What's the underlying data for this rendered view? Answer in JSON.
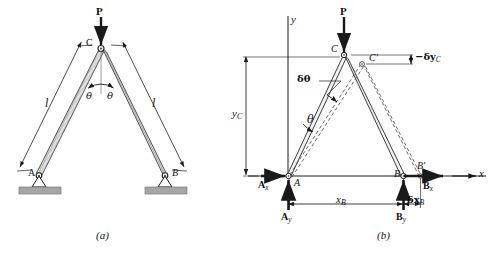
{
  "figure": {
    "background": "#ffffff",
    "ink": "#1a1a1a",
    "member_fill": "#d9d9d9",
    "ground_fill": "#9a9a9a",
    "dash_color": "#555555"
  },
  "panel_a": {
    "caption": "(a)",
    "load_label": "P",
    "joint_c": "C",
    "joint_a": "A",
    "joint_b": "B",
    "length_left": "l",
    "length_right": "l",
    "angle_left": "θ",
    "angle_right": "θ",
    "icons": {
      "load_arrow": "down-arrow-icon",
      "pin_support": "pin-support-icon",
      "ground_hatch": "ground-hatch-icon",
      "dimension_arrow": "dimension-arrow-icon",
      "angle_arc": "angle-arc-icon"
    }
  },
  "panel_b": {
    "caption": "(b)",
    "axis_y": "y",
    "axis_x": "x",
    "load_label": "P",
    "joint_c": "C",
    "joint_c_displaced": "C'",
    "joint_a": "A",
    "joint_b": "B",
    "joint_b_displaced": "B'",
    "reaction_ax": "A",
    "reaction_ax_sub": "x",
    "reaction_ay": "A",
    "reaction_ay_sub": "y",
    "reaction_bx": "B",
    "reaction_bx_sub": "x",
    "reaction_by": "B",
    "reaction_by_sub": "y",
    "dim_yc": "y",
    "dim_yc_sub": "C",
    "dim_xb": "x",
    "dim_xb_sub": "B",
    "virt_dtheta": "δθ",
    "virt_theta": "θ",
    "virt_dxb": "δx",
    "virt_dxb_sub": "B",
    "virt_dyc": "−δy",
    "virt_dyc_sub": "C",
    "icons": {
      "load_arrow": "down-arrow-icon",
      "reaction_arrow": "force-arrow-icon",
      "axis_arrow": "axis-arrow-icon",
      "dimension_arrow": "dimension-arrow-icon",
      "angle_arc": "angle-arc-icon",
      "displaced_member": "dashed-line-icon",
      "leader_line": "leader-line-icon"
    }
  }
}
